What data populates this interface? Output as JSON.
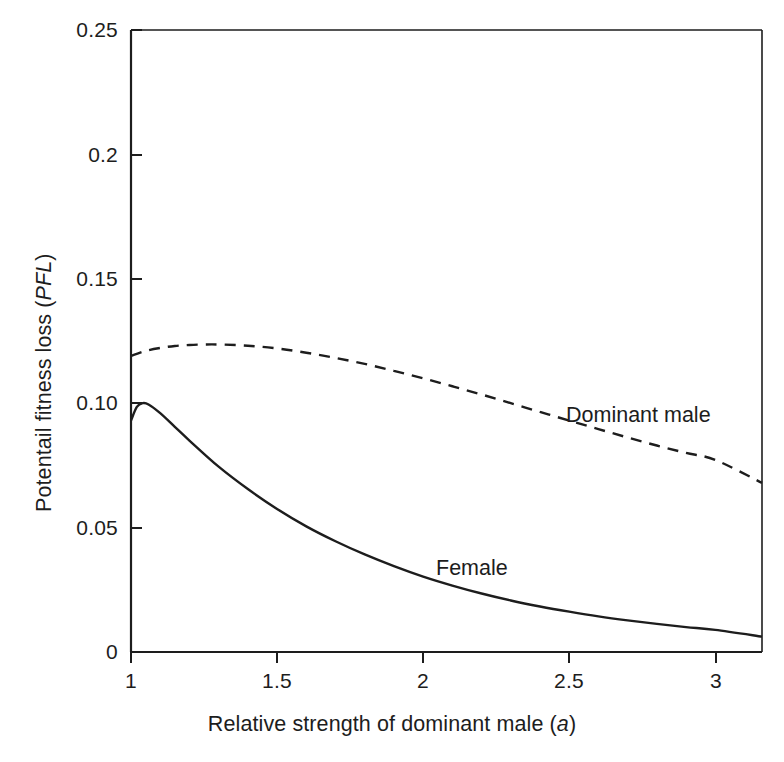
{
  "figure": {
    "background_color": "#ffffff",
    "line_color": "#1d1d1d"
  },
  "axes": {
    "x_title_prefix": "Relative strength of dominant male (",
    "x_title_italic": "a",
    "x_title_suffix": ")",
    "y_title_prefix": "Potentail fitness loss (",
    "y_title_italic": "PFL",
    "y_title_suffix": ")",
    "x_tick_labels": [
      "1",
      "1.5",
      "2",
      "2.5",
      "3"
    ],
    "y_tick_labels": [
      "0",
      "0.05",
      "0.10",
      "0.15",
      "0.2",
      "0.25"
    ]
  },
  "annotations": {
    "dominant_male_label": "Dominant male",
    "female_label": "Female"
  },
  "chart_data": {
    "type": "line",
    "title": "",
    "xlabel": "Relative strength of dominant male (a)",
    "ylabel": "Potentail fitness loss (PFL)",
    "xlim": [
      1,
      3.16
    ],
    "ylim": [
      0,
      0.25
    ],
    "xticks": [
      1,
      1.5,
      2,
      2.5,
      3
    ],
    "yticks": [
      0,
      0.05,
      0.1,
      0.15,
      0.2,
      0.25
    ],
    "grid": false,
    "legend_position": "inline-annotations",
    "series": [
      {
        "name": "Dominant male",
        "style": "dashed",
        "color": "#1d1d1d",
        "x": [
          1.0,
          1.05,
          1.1,
          1.15,
          1.2,
          1.25,
          1.3,
          1.4,
          1.5,
          1.6,
          1.7,
          1.8,
          1.9,
          2.0,
          2.1,
          2.2,
          2.3,
          2.4,
          2.5,
          2.6,
          2.7,
          2.8,
          2.9,
          3.0,
          3.16
        ],
        "values": [
          0.119,
          0.121,
          0.1222,
          0.123,
          0.1234,
          0.1236,
          0.1236,
          0.1231,
          0.122,
          0.1203,
          0.1182,
          0.1158,
          0.113,
          0.11,
          0.1068,
          0.1035,
          0.1,
          0.0965,
          0.093,
          0.0896,
          0.0862,
          0.083,
          0.08,
          0.0772,
          0.068
        ]
      },
      {
        "name": "Female",
        "style": "solid",
        "color": "#1d1d1d",
        "x": [
          1.0,
          1.02,
          1.04,
          1.06,
          1.1,
          1.15,
          1.2,
          1.3,
          1.4,
          1.5,
          1.6,
          1.7,
          1.8,
          1.9,
          2.0,
          2.1,
          2.2,
          2.3,
          2.4,
          2.5,
          2.6,
          2.7,
          2.8,
          2.9,
          3.0,
          3.16
        ],
        "values": [
          0.093,
          0.0985,
          0.1,
          0.0995,
          0.096,
          0.0905,
          0.085,
          0.0745,
          0.0655,
          0.0575,
          0.0505,
          0.0445,
          0.0392,
          0.0345,
          0.0303,
          0.0267,
          0.0235,
          0.0207,
          0.0183,
          0.0162,
          0.0143,
          0.0127,
          0.0113,
          0.01,
          0.0089,
          0.0062
        ]
      }
    ]
  }
}
